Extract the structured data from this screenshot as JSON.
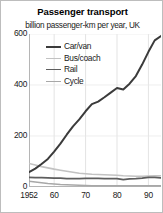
{
  "chart_data": {
    "type": "line",
    "title": "Passenger transport",
    "subtitle": "billion passenger-km per year, UK",
    "xlabel": "",
    "ylabel": "",
    "ylim": [
      0,
      600
    ],
    "xlim": [
      1952,
      1994
    ],
    "grid": "vertical",
    "legend_position": "top-left-inside",
    "yticks": [
      {
        "value": 600,
        "label": "600"
      },
      {
        "value": 400,
        "label": "400"
      },
      {
        "value": 200,
        "label": "200"
      },
      {
        "value": 0,
        "label": "0"
      }
    ],
    "xticks": [
      {
        "value": 1952,
        "label": "1952"
      },
      {
        "value": 1960,
        "label": "60"
      },
      {
        "value": 1970,
        "label": "70"
      },
      {
        "value": 1980,
        "label": "80"
      },
      {
        "value": 1990,
        "label": "90"
      }
    ],
    "x": [
      1952,
      1954,
      1956,
      1958,
      1960,
      1962,
      1964,
      1966,
      1968,
      1970,
      1972,
      1974,
      1976,
      1978,
      1980,
      1982,
      1984,
      1986,
      1988,
      1990,
      1992,
      1994
    ],
    "series": [
      {
        "name": "Car/van",
        "color": "#3b3b3b",
        "width": 2.0,
        "values": [
          58,
          72,
          90,
          110,
          139,
          170,
          205,
          238,
          265,
          297,
          325,
          335,
          352,
          370,
          388,
          382,
          405,
          435,
          480,
          530,
          575,
          592
        ]
      },
      {
        "name": "Bus/coach",
        "color": "#c2c2c2",
        "width": 1.6,
        "values": [
          92,
          86,
          80,
          75,
          70,
          66,
          62,
          58,
          54,
          52,
          50,
          49,
          48,
          47,
          46,
          44,
          43,
          42,
          42,
          43,
          44,
          44
        ]
      },
      {
        "name": "Rail",
        "color": "#5e5e5e",
        "width": 1.7,
        "values": [
          38,
          37,
          37,
          36,
          35,
          35,
          33,
          33,
          33,
          34,
          34,
          34,
          33,
          33,
          33,
          29,
          32,
          33,
          35,
          38,
          38,
          36
        ]
      },
      {
        "name": "Cycle",
        "color": "#a8a8a8",
        "width": 1.5,
        "values": [
          23,
          20,
          17,
          14,
          12,
          10,
          9,
          8,
          7,
          6,
          5,
          5,
          5,
          5,
          5,
          5,
          5,
          5,
          5,
          5,
          5,
          5
        ]
      }
    ]
  }
}
